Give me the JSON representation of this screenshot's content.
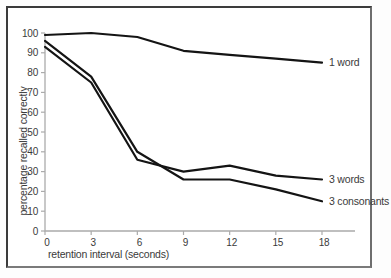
{
  "figure": {
    "background": "#ffffff",
    "frame_color": "#3b3b3b"
  },
  "chart_data": {
    "type": "line",
    "xlabel": "retention interval (seconds)",
    "ylabel": "percentage recalled correctly",
    "x": [
      0,
      3,
      6,
      9,
      12,
      15,
      18
    ],
    "xticks": [
      0,
      3,
      6,
      9,
      12,
      15,
      18
    ],
    "yticks": [
      0,
      10,
      20,
      30,
      40,
      50,
      60,
      70,
      80,
      90,
      100
    ],
    "xlim": [
      0,
      18
    ],
    "ylim": [
      0,
      100
    ],
    "grid": false,
    "legend_position": "right-end-labels",
    "series": [
      {
        "name": "1 word",
        "values": [
          99,
          100,
          98,
          91,
          89,
          87,
          85
        ]
      },
      {
        "name": "3 words",
        "values": [
          93,
          75,
          36,
          30,
          33,
          28,
          26
        ]
      },
      {
        "name": "3 consonants",
        "values": [
          96,
          78,
          40,
          26,
          26,
          21,
          15
        ]
      }
    ],
    "line_color": "#141414",
    "axis_color": "#ababab",
    "text_color": "#3a3a3a"
  }
}
